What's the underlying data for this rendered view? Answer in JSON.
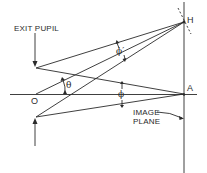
{
  "diagram": {
    "labels": {
      "exit_pupil": "EXIT PUPIL",
      "point_h": "H",
      "point_a": "A",
      "point_o": "O",
      "theta": "θ",
      "phi": "ϕ",
      "phi_prime": "ϕ′",
      "image_plane_line1": "IMAGE",
      "image_plane_line2": "PLANE"
    },
    "colors": {
      "line": "#2a2a2a",
      "background": "#ffffff"
    }
  }
}
